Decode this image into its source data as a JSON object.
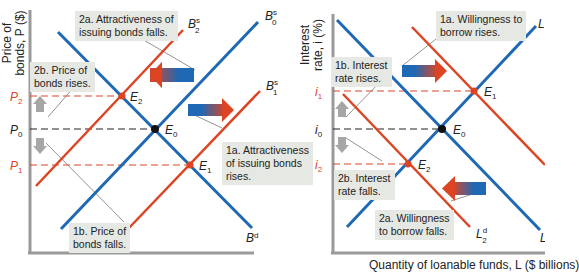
{
  "colors": {
    "blue": "#1f68b4",
    "red": "#dc4424",
    "gray_axis": "#9a9a9a",
    "callout_bg": "#e6e8e3",
    "dash_dark": "#222222"
  },
  "left_panel": {
    "y_axis_title": "Price of\nbonds, P ($)",
    "price_labels": {
      "p2": "P",
      "p2_sub": "2",
      "p0": "P",
      "p0_sub": "0",
      "p1": "P",
      "p1_sub": "1"
    },
    "curves": {
      "bd": {
        "label": "B",
        "sup": "d"
      },
      "b0s": {
        "label": "B",
        "sup": "s",
        "sub": "0"
      },
      "b1s": {
        "label": "B",
        "sup": "s",
        "sub": "1"
      },
      "b2s": {
        "label": "B",
        "sup": "s",
        "sub": "2"
      }
    },
    "equilibria": {
      "e0": "E",
      "e0_sub": "0",
      "e1": "E",
      "e1_sub": "1",
      "e2": "E",
      "e2_sub": "2"
    },
    "callouts": {
      "c2a": "2a. Attractiveness of\nissuing bonds falls.",
      "c2b": "2b. Price of\nbonds rises.",
      "c1a": "1a. Attractiveness\nof issuing bonds\nrises.",
      "c1b": "1b. Price of\nbonds falls."
    }
  },
  "right_panel": {
    "y_axis_title": "Interest\nrate, i (%)",
    "x_axis_title": "Quantity of loanable funds, L ($ billions)",
    "rate_labels": {
      "i1": "i",
      "i1_sub": "1",
      "i0": "i",
      "i0_sub": "0",
      "i2": "i",
      "i2_sub": "2"
    },
    "curves": {
      "ls": {
        "label": "L"
      },
      "ld": {
        "label": "L"
      },
      "l2d": {
        "label": "L",
        "sup": "d",
        "sub": "2"
      }
    },
    "equilibria": {
      "e0": "E",
      "e0_sub": "0",
      "e1": "E",
      "e1_sub": "1",
      "e2": "E",
      "e2_sub": "2"
    },
    "callouts": {
      "c1a": "1a. Willingness to\nborrow rises.",
      "c1b": "1b. Interest\nrate rises.",
      "c2a": "2a. Willingness\nto borrow falls.",
      "c2b": "2b. Interest\nrate falls."
    }
  }
}
